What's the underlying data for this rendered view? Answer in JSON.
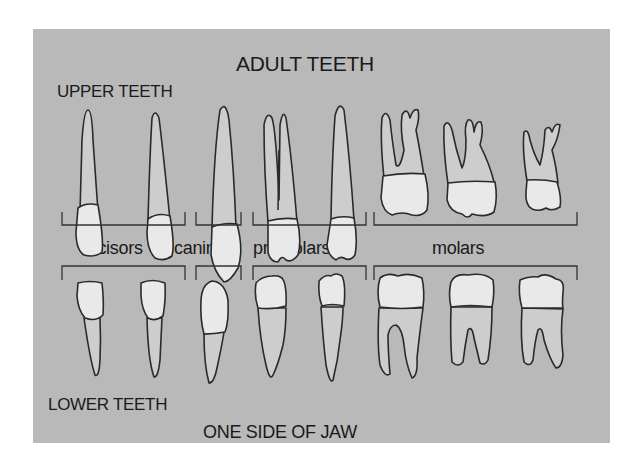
{
  "diagram": {
    "title": "ADULT TEETH",
    "upper_label": "UPPER TEETH",
    "lower_label": "LOWER TEETH",
    "footer": "ONE SIDE OF JAW",
    "categories": [
      {
        "label": "incisors",
        "count": 2
      },
      {
        "label": "canines",
        "count": 1
      },
      {
        "label": "premolars",
        "count": 2
      },
      {
        "label": "molars",
        "count": 3
      }
    ],
    "colors": {
      "background": "#b9b9b9",
      "crown": "#e9e9e9",
      "root": "#cdcdcd",
      "outline": "#2a2a2a"
    }
  }
}
